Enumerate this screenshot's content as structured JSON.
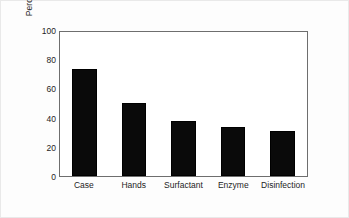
{
  "chart_data": {
    "type": "bar",
    "title": "",
    "subtitle": "",
    "xlabel": "",
    "ylabel": "Percentage of subjects",
    "categories": [
      "Case",
      "Hands",
      "Surfactant",
      "Enzyme",
      "Disinfection"
    ],
    "values": [
      74,
      51,
      38,
      34,
      31
    ],
    "series": [
      {
        "name": "Percentage of subjects",
        "values": [
          74,
          51,
          38,
          34,
          31
        ]
      }
    ],
    "ylim": [
      0,
      100
    ],
    "yticks": [
      0,
      20,
      40,
      60,
      80,
      100
    ],
    "ytick_labels": [
      "0",
      "20",
      "40",
      "60",
      "80",
      "100"
    ],
    "grid": false,
    "legend": false,
    "legend_position": "none",
    "bar_color": "#0a0a0a",
    "frame_color": "#6e6e6e",
    "annotations": []
  }
}
